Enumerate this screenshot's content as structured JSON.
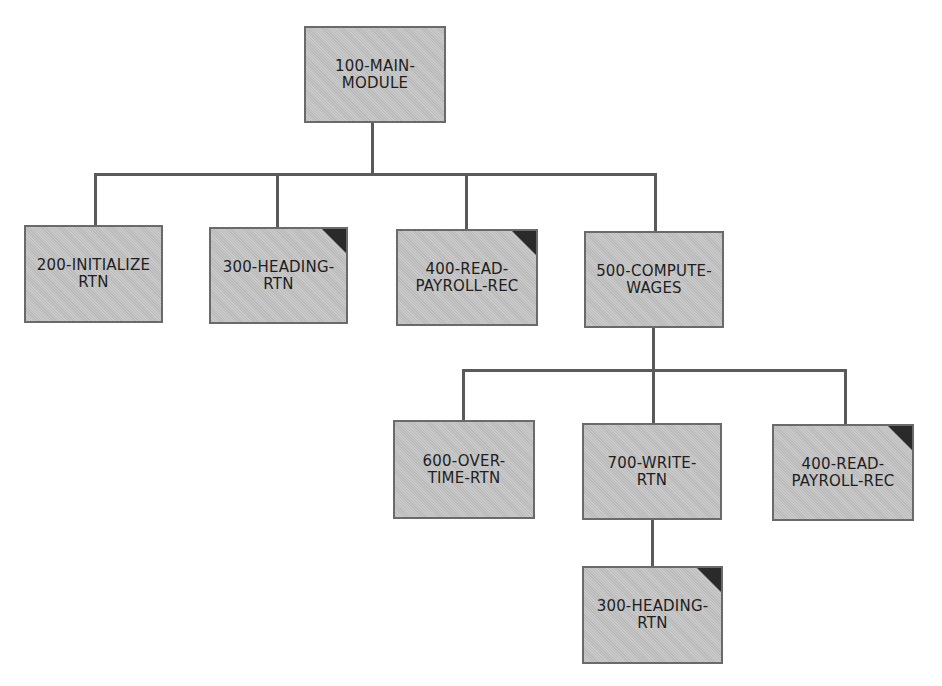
{
  "diagram": {
    "colors": {
      "box_fill": "#c4c4c4",
      "box_border": "#6a6a6a",
      "connector": "#5a5a5a",
      "corner_marker": "#2a2a2a",
      "text": "#1e1e1e"
    },
    "legend_note": "Dark corner marks a module shown more than once (repeated reference)",
    "nodes": [
      {
        "id": "main",
        "label": "100-MAIN-\nMODULE",
        "repeated": false,
        "parent": null
      },
      {
        "id": "init",
        "label": "200-INITIALIZE\nRTN",
        "repeated": false,
        "parent": "main"
      },
      {
        "id": "heading1",
        "label": "300-HEADING-\nRTN",
        "repeated": true,
        "parent": "main"
      },
      {
        "id": "read1",
        "label": "400-READ-\nPAYROLL-REC",
        "repeated": true,
        "parent": "main"
      },
      {
        "id": "compute",
        "label": "500-COMPUTE-\nWAGES",
        "repeated": false,
        "parent": "main"
      },
      {
        "id": "overtime",
        "label": "600-OVER-\nTIME-RTN",
        "repeated": false,
        "parent": "compute"
      },
      {
        "id": "write",
        "label": "700-WRITE-\nRTN",
        "repeated": false,
        "parent": "compute"
      },
      {
        "id": "read2",
        "label": "400-READ-\nPAYROLL-REC",
        "repeated": true,
        "parent": "compute"
      },
      {
        "id": "heading2",
        "label": "300-HEADING-\nRTN",
        "repeated": true,
        "parent": "write"
      }
    ]
  }
}
